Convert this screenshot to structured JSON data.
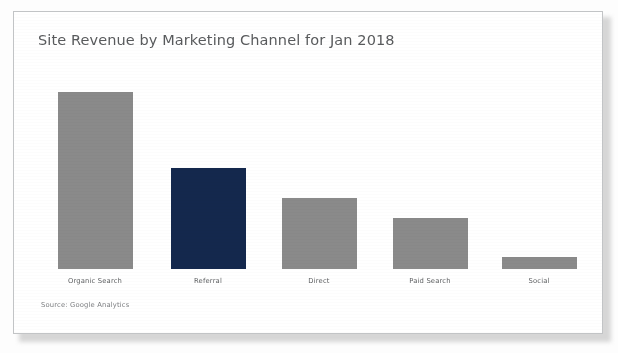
{
  "card": {
    "title": "Site Revenue by Marketing Channel for Jan 2018",
    "source_note": "Source: Google Analytics"
  },
  "colors": {
    "bar_default": "#8a8a8a",
    "bar_highlight": "#14284d",
    "title_text": "#595b5d",
    "label_text": "#5d5f61",
    "card_border": "#c2c4c6",
    "card_background": "#ffffff"
  },
  "chart_data": {
    "type": "bar",
    "title": "Site Revenue by Marketing Channel for Jan 2018",
    "xlabel": "",
    "ylabel": "",
    "ylim": [
      0,
      100
    ],
    "grid": false,
    "legend": "none",
    "axis_labels_visible": false,
    "categories": [
      "Organic Search",
      "Referral",
      "Direct",
      "Paid Search",
      "Social"
    ],
    "values": [
      100,
      57,
      40,
      29,
      7
    ],
    "bar_colors": [
      "#8a8a8a",
      "#14284d",
      "#8a8a8a",
      "#8a8a8a",
      "#8a8a8a"
    ],
    "highlighted_category": "Referral",
    "annotations": [
      "Source: Google Analytics"
    ]
  }
}
